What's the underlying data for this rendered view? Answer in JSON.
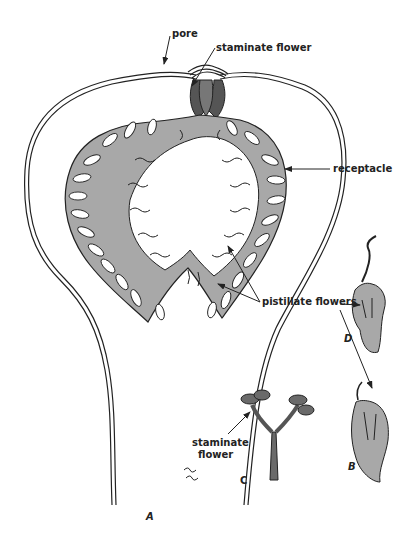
{
  "diagram": {
    "labels": {
      "pore": "pore",
      "staminate_top": "staminate flower",
      "receptacle": "receptacle",
      "pistillate": "pistillate flowers",
      "staminate_c": "staminate\nflower"
    },
    "staminate_c_line1": "staminate",
    "staminate_c_line2": "flower",
    "panel_letters": {
      "A": "A",
      "B": "B",
      "C": "C",
      "D": "D"
    },
    "colors": {
      "outline": "#222222",
      "fill_gray": "#a8a8a8",
      "background": "#ffffff"
    }
  }
}
